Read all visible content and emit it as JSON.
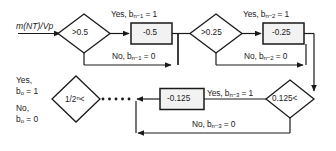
{
  "diagram": {
    "input": {
      "label": "m(NT)/Vp",
      "name": "input-signal"
    },
    "decisions": [
      {
        "id": "d1",
        "text": ">0.5"
      },
      {
        "id": "d2",
        "text": ">0.25"
      },
      {
        "id": "d3",
        "text": "0.125<"
      },
      {
        "id": "d4",
        "text": "1/2",
        "exponent": "n",
        "suffix": "<"
      }
    ],
    "operations": [
      {
        "id": "op1",
        "text": "-0.5"
      },
      {
        "id": "op2",
        "text": "-0.25"
      },
      {
        "id": "op3",
        "text": "-0.125"
      }
    ],
    "branches": [
      {
        "id": "b1yes",
        "prefix": "Yes, b",
        "sub": "n−1",
        "suffix": "= 1"
      },
      {
        "id": "b1no",
        "prefix": "No, b",
        "sub": "n−1",
        "suffix": "= 0"
      },
      {
        "id": "b2yes",
        "prefix": "Yes, b",
        "sub": "n−2",
        "suffix": "= 1"
      },
      {
        "id": "b2no",
        "prefix": "No, b",
        "sub": "n−2",
        "suffix": "= 0"
      },
      {
        "id": "b3yes",
        "prefix": "Yes, b",
        "sub": "n−3",
        "suffix": "= 1"
      },
      {
        "id": "b3no",
        "prefix": "No, b",
        "sub": "n−3",
        "suffix": "= 0"
      }
    ],
    "outputs": [
      {
        "id": "oyes",
        "line1": "Yes,",
        "prefix": "b",
        "sub": "o",
        "suffix": "= 1"
      },
      {
        "id": "ono",
        "line1": "No,",
        "prefix": "b",
        "sub": "o",
        "suffix": "= 0"
      }
    ],
    "colors": {
      "stroke": "#1a1a1a",
      "text": "#1a1a1a",
      "background": "#ffffff",
      "box_fill": "#f2f2f2"
    }
  }
}
